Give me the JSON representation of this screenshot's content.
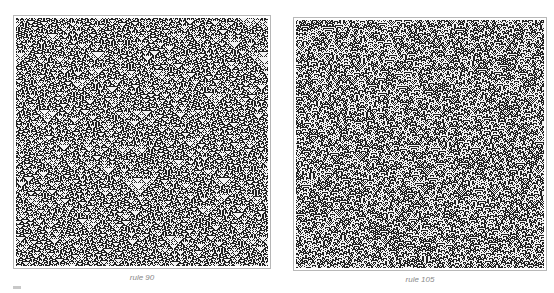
{
  "figure": {
    "panels": [
      {
        "id": "left",
        "caption": "rule 90",
        "rule": 90,
        "seed": 12345,
        "density": 0.5
      },
      {
        "id": "right",
        "caption": "rule 105",
        "rule": 105,
        "seed": 67890,
        "density": 0.5
      }
    ],
    "colors": {
      "cell_on": "#222222",
      "cell_off": "#f2f2f2",
      "border": "#b8b8b8",
      "caption": "#8a8a8a"
    }
  }
}
